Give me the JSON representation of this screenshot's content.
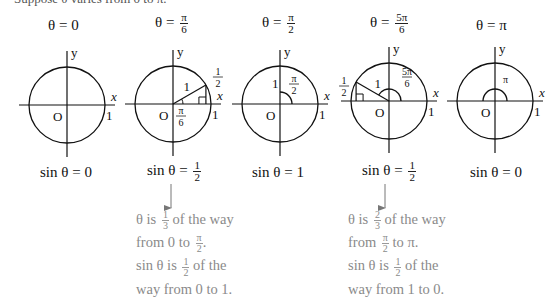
{
  "intro_text": "Suppose θ varies from 0 to π.",
  "axis_labels": {
    "x": "x",
    "y": "y",
    "origin": "O",
    "one": "1"
  },
  "panels": [
    {
      "title_prefix": "θ = ",
      "title_value": "0",
      "title_frac": null,
      "caption_prefix": "sin θ = ",
      "caption_value": "0",
      "caption_frac": null
    },
    {
      "title_prefix": "θ = ",
      "title_value": "",
      "title_frac": {
        "num": "π",
        "den": "6"
      },
      "caption_prefix": "sin θ = ",
      "caption_value": "",
      "caption_frac": {
        "num": "1",
        "den": "2"
      },
      "radius_label": "1",
      "angle_label": {
        "num": "π",
        "den": "6"
      },
      "height_label": {
        "num": "1",
        "den": "2"
      }
    },
    {
      "title_prefix": "θ = ",
      "title_value": "",
      "title_frac": {
        "num": "π",
        "den": "2"
      },
      "caption_prefix": "sin θ = ",
      "caption_value": "1",
      "caption_frac": null,
      "radius_label": "1",
      "angle_label": {
        "num": "π",
        "den": "2"
      }
    },
    {
      "title_prefix": "θ = ",
      "title_value": "",
      "title_frac": {
        "num": "5π",
        "den": "6"
      },
      "caption_prefix": "sin θ = ",
      "caption_value": "",
      "caption_frac": {
        "num": "1",
        "den": "2"
      },
      "radius_label": "1",
      "angle_label": {
        "num": "5π",
        "den": "6"
      },
      "height_label": {
        "num": "1",
        "den": "2"
      }
    },
    {
      "title_prefix": "θ = ",
      "title_value": "π",
      "title_frac": null,
      "caption_prefix": "sin θ = ",
      "caption_value": "0",
      "caption_frac": null,
      "angle_label": {
        "num": "π",
        "den": ""
      }
    }
  ],
  "notes": [
    {
      "l1a": "θ is ",
      "l1f": {
        "num": "1",
        "den": "3"
      },
      "l1b": " of the way",
      "l2a": "from 0 to ",
      "l2f": {
        "num": "π",
        "den": "2"
      },
      "l2b": ".",
      "l3a": "sin θ is ",
      "l3f": {
        "num": "1",
        "den": "2"
      },
      "l3b": " of the",
      "l4": "way from 0 to 1."
    },
    {
      "l1a": "θ is ",
      "l1f": {
        "num": "2",
        "den": "3"
      },
      "l1b": " of the way",
      "l2a": "from ",
      "l2f": {
        "num": "π",
        "den": "2"
      },
      "l2b": " to π.",
      "l3a": "sin θ is ",
      "l3f": {
        "num": "1",
        "den": "2"
      },
      "l3b": " of the",
      "l4": "way from 1 to 0."
    }
  ]
}
